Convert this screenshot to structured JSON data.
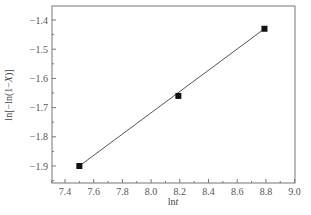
{
  "chart_data": {
    "type": "line",
    "title": "",
    "xlabel": "lnt",
    "ylabel": "ln[−ln(1−X)]",
    "xlim": [
      7.3,
      9.0
    ],
    "ylim": [
      -1.95,
      -1.35
    ],
    "xticks": [
      7.4,
      7.6,
      7.8,
      8.0,
      8.2,
      8.4,
      8.6,
      8.8,
      9.0
    ],
    "xtick_labels": [
      "7.4",
      "7.6",
      "7.8",
      "8.0",
      "8.2",
      "8.4",
      "8.6",
      "8.8",
      "9.0"
    ],
    "yticks": [
      -1.4,
      -1.5,
      -1.6,
      -1.7,
      -1.8,
      -1.9
    ],
    "ytick_labels": [
      "−1.4",
      "−1.5",
      "−1.6",
      "−1.7",
      "−1.8",
      "−1.9"
    ],
    "grid": false,
    "legend": null,
    "series": [
      {
        "name": "data",
        "marker": "square",
        "x": [
          7.5,
          8.19,
          8.79
        ],
        "y": [
          -1.9,
          -1.66,
          -1.43
        ]
      }
    ],
    "fit_line": {
      "x": [
        7.5,
        8.79
      ],
      "y": [
        -1.9,
        -1.43
      ]
    }
  },
  "caption": {
    "text": ""
  }
}
